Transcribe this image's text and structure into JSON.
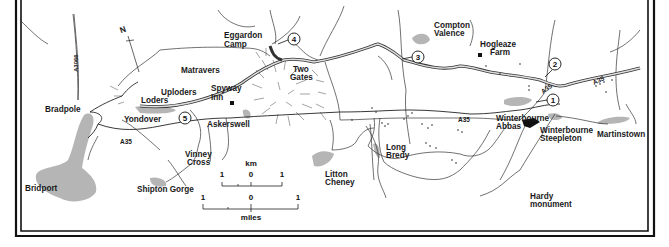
{
  "map": {
    "north_label": "N",
    "roads": {
      "a3066": "A3066",
      "a35_west": "A35",
      "a35_center": "A35",
      "a35_east_lower": "A35",
      "a35_east_upper": "A35"
    },
    "places": {
      "bradpole": "Bradpole",
      "bridport": "Bridport",
      "loders": "Loders",
      "uploders": "Uploders",
      "matravers": "Matravers",
      "yondover": "Yondover",
      "spyway_inn_1": "Spyway",
      "spyway_inn_2": "Inn",
      "askerswell": "Askerswell",
      "vinney_cross_1": "Vinney",
      "vinney_cross_2": "Cross",
      "shipton_gorge": "Shipton Gorge",
      "eggardon_camp_1": "Eggardon",
      "eggardon_camp_2": "Camp",
      "two_gates_1": "Two",
      "two_gates_2": "Gates",
      "litton_cheney_1": "Litton",
      "litton_cheney_2": "Cheney",
      "long_bredy_1": "Long",
      "long_bredy_2": "Bredy",
      "compton_valence_1": "Compton",
      "compton_valence_2": "Valence",
      "hogleaze_farm_1": "Hogleaze",
      "hogleaze_farm_2": "Farm",
      "winterbourne_abbas_1": "Winterbourne",
      "winterbourne_abbas_2": "Abbas",
      "winterbourne_steepleton_1": "Winterbourne",
      "winterbourne_steepleton_2": "Steepleton",
      "martinstown": "Martinstown",
      "hardy_monument_1": "Hardy",
      "hardy_monument_2": "monument"
    },
    "waypoints": [
      "1",
      "2",
      "3",
      "4",
      "5"
    ],
    "scale": {
      "km_label": "km",
      "km_ticks": [
        "1",
        "0",
        "1"
      ],
      "miles_ticks": [
        "1",
        "0",
        "1"
      ],
      "miles_label": "miles"
    }
  }
}
